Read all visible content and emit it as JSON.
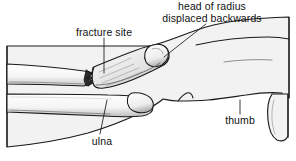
{
  "figure": {
    "colors": {
      "ink": "#1a1a1a",
      "skin_fill": "#f2f2f2",
      "bone_fill": "#fbfbfb",
      "shade": "#b8b8b8",
      "background": "#ffffff"
    },
    "labels": {
      "head_of_radius_line1": "head of radius",
      "head_of_radius_line2": "displaced backwards",
      "fracture_site": "fracture site",
      "ulna": "ulna",
      "thumb": "thumb"
    },
    "leader_lines": [
      {
        "name": "head-of-radius-leader",
        "x1": 206,
        "y1": 24,
        "x2": 164,
        "y2": 57
      },
      {
        "name": "fracture-site-leader",
        "x1": 104,
        "y1": 38,
        "x2": 104,
        "y2": 73
      },
      {
        "name": "ulna-leader",
        "x1": 107,
        "y1": 100,
        "x2": 100,
        "y2": 134
      },
      {
        "name": "thumb-leader",
        "x1": 240,
        "y1": 100,
        "x2": 240,
        "y2": 114
      }
    ]
  }
}
